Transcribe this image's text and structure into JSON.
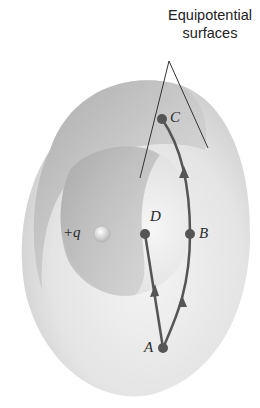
{
  "figure": {
    "title_line1": "Equipotential",
    "title_line2": "surfaces",
    "charge_label": "+q",
    "points": {
      "A": "A",
      "B": "B",
      "C": "C",
      "D": "D"
    },
    "colors": {
      "outer_shell": "#d8d8d8",
      "inner_cavity": "#bdbdbd",
      "path": "#555555",
      "point": "#555555",
      "background": "#ffffff"
    }
  }
}
